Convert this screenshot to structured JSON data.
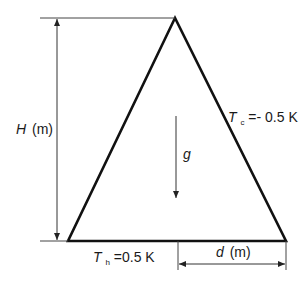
{
  "diagram": {
    "type": "triangular cavity schematic",
    "labels": {
      "height": {
        "symbol": "H",
        "unit": "(m)"
      },
      "width": {
        "symbol": "d",
        "unit": "(m)"
      },
      "gravity": {
        "symbol": "g"
      },
      "cold_wall": {
        "symbol": "T",
        "subscript": "c",
        "value": "=- 0.5 K"
      },
      "hot_wall": {
        "symbol": "T",
        "subscript": "h",
        "value": "=0.5 K"
      }
    },
    "colors": {
      "stroke": "#111111",
      "dim_line": "#333333",
      "background": "#ffffff"
    }
  }
}
